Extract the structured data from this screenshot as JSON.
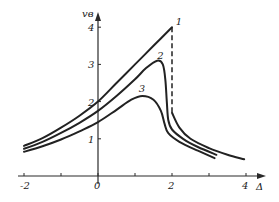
{
  "chart_data": {
    "type": "line",
    "title": "",
    "xlabel": "Δ",
    "ylabel": "vв",
    "xlim": [
      -2.2,
      4.6
    ],
    "ylim": [
      0,
      4.5
    ],
    "grid": false,
    "legend": "inline curve labels",
    "x_ticks": [
      {
        "value": -2,
        "label": "-2"
      },
      {
        "value": -1,
        "label": ""
      },
      {
        "value": 0,
        "label": "0"
      },
      {
        "value": 1,
        "label": ""
      },
      {
        "value": 2,
        "label": "2"
      },
      {
        "value": 3,
        "label": ""
      },
      {
        "value": 4,
        "label": "4"
      }
    ],
    "y_ticks": [
      {
        "value": 1,
        "label": "1"
      },
      {
        "value": 2,
        "label": "2"
      },
      {
        "value": 3,
        "label": "3"
      },
      {
        "value": 4,
        "label": "4"
      }
    ],
    "series": [
      {
        "name": "1",
        "label_at": [
          2.1,
          4.05
        ],
        "points": [
          [
            -2,
            0.81
          ],
          [
            -1.5,
            1.02
          ],
          [
            -1,
            1.3
          ],
          [
            -0.5,
            1.62
          ],
          [
            0,
            2.0
          ],
          [
            0.5,
            2.5
          ],
          [
            1,
            3.0
          ],
          [
            1.5,
            3.5
          ],
          [
            2,
            4.0
          ]
        ],
        "dashed_drop": [
          [
            2,
            4.0
          ],
          [
            2,
            1.7
          ]
        ],
        "tail": [
          [
            2,
            1.7
          ],
          [
            2.2,
            1.3
          ],
          [
            2.5,
            1.0
          ],
          [
            3,
            0.75
          ],
          [
            3.5,
            0.57
          ],
          [
            3.95,
            0.45
          ]
        ]
      },
      {
        "name": "2",
        "label_at": [
          1.6,
          3.15
        ],
        "points": [
          [
            -2,
            0.73
          ],
          [
            -1.5,
            0.92
          ],
          [
            -1,
            1.16
          ],
          [
            -0.5,
            1.43
          ],
          [
            0,
            1.75
          ],
          [
            0.5,
            2.15
          ],
          [
            1,
            2.6
          ],
          [
            1.3,
            2.9
          ],
          [
            1.6,
            3.1
          ],
          [
            1.75,
            3.0
          ],
          [
            1.82,
            2.6
          ],
          [
            1.86,
            2.0
          ],
          [
            1.9,
            1.5
          ],
          [
            2.0,
            1.25
          ],
          [
            2.3,
            1.0
          ],
          [
            2.7,
            0.78
          ],
          [
            3.2,
            0.57
          ]
        ]
      },
      {
        "name": "3",
        "label_at": [
          1.1,
          2.25
        ],
        "points": [
          [
            -2,
            0.65
          ],
          [
            -1.5,
            0.8
          ],
          [
            -1,
            0.98
          ],
          [
            -0.5,
            1.2
          ],
          [
            0,
            1.45
          ],
          [
            0.5,
            1.78
          ],
          [
            0.9,
            2.05
          ],
          [
            1.2,
            2.15
          ],
          [
            1.5,
            2.05
          ],
          [
            1.7,
            1.75
          ],
          [
            1.8,
            1.4
          ],
          [
            1.9,
            1.15
          ],
          [
            2.2,
            0.92
          ],
          [
            2.7,
            0.68
          ],
          [
            3.15,
            0.48
          ]
        ]
      }
    ]
  }
}
